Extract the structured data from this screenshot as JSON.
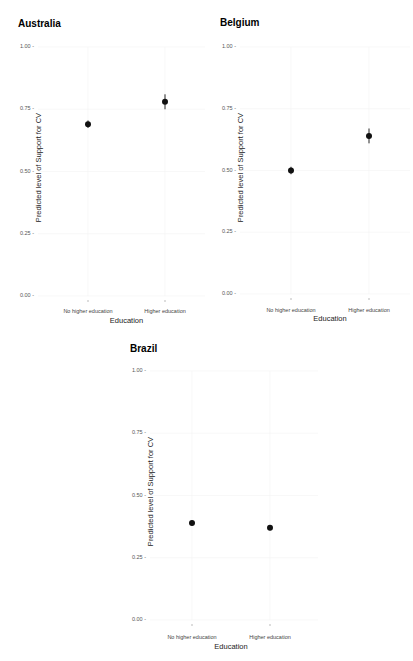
{
  "chart_data": [
    {
      "type": "scatter",
      "title": "Australia",
      "xlabel": "Education",
      "ylabel": "Predicted level of Support for CV",
      "categories": [
        "No higher education",
        "Higher education"
      ],
      "values": [
        0.69,
        0.78
      ],
      "ci_low": [
        0.675,
        0.75
      ],
      "ci_high": [
        0.705,
        0.81
      ],
      "ylim": [
        0,
        1
      ],
      "yticks": [
        "0.00",
        "0.25",
        "0.50",
        "0.75",
        "1.00"
      ],
      "grid": true
    },
    {
      "type": "scatter",
      "title": "Belgium",
      "xlabel": "Education",
      "ylabel": "Predicted level of Support for CV",
      "categories": [
        "No higher education",
        "Higher education"
      ],
      "values": [
        0.5,
        0.64
      ],
      "ci_low": [
        0.485,
        0.61
      ],
      "ci_high": [
        0.515,
        0.67
      ],
      "ylim": [
        0,
        1
      ],
      "yticks": [
        "0.00",
        "0.25",
        "0.50",
        "0.75",
        "1.00"
      ],
      "grid": true
    },
    {
      "type": "scatter",
      "title": "Brazil",
      "xlabel": "Education",
      "ylabel": "Predicted level of Support for CV",
      "categories": [
        "No higher education",
        "Higher education"
      ],
      "values": [
        0.39,
        0.37
      ],
      "ci_low": [
        0.38,
        0.36
      ],
      "ci_high": [
        0.4,
        0.38
      ],
      "ylim": [
        0,
        1
      ],
      "yticks": [
        "0.00",
        "0.25",
        "0.50",
        "0.75",
        "1.00"
      ],
      "grid": true
    }
  ],
  "colors": {
    "point": "#111111",
    "grid": "#f4f4f4",
    "tick_text": "#555555"
  }
}
